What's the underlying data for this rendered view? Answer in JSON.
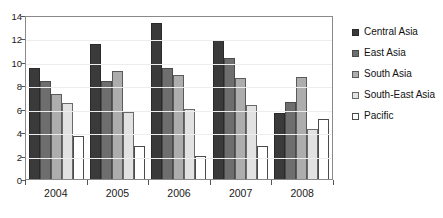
{
  "chart_data": {
    "type": "bar",
    "title": "",
    "subtitle": "",
    "xlabel": "",
    "ylabel": "",
    "categories": [
      "2004",
      "2005",
      "2006",
      "2007",
      "2008"
    ],
    "series": [
      {
        "name": "Central Asia",
        "values": [
          9.5,
          11.5,
          13.3,
          11.9,
          5.6
        ],
        "color": "#3a3a3a"
      },
      {
        "name": "East Asia",
        "values": [
          8.4,
          8.4,
          9.5,
          10.3,
          6.6
        ],
        "color": "#6e6e6e"
      },
      {
        "name": "South Asia",
        "values": [
          7.3,
          9.2,
          8.9,
          8.6,
          8.7
        ],
        "color": "#adadad"
      },
      {
        "name": "South-East Asia",
        "values": [
          6.5,
          5.7,
          6.0,
          6.3,
          4.3
        ],
        "color": "#e2e2e2"
      },
      {
        "name": "Pacific",
        "values": [
          3.7,
          2.8,
          2.0,
          2.8,
          5.1
        ],
        "color": "#ffffff"
      }
    ],
    "ylim": [
      0,
      14
    ],
    "yticks": [
      0,
      2,
      4,
      6,
      8,
      10,
      12,
      14
    ],
    "ytick_labels": [
      "0",
      "2",
      "4",
      "6",
      "8",
      "10",
      "12",
      "14"
    ],
    "grid": true,
    "legend_position": "right",
    "annotations": []
  }
}
